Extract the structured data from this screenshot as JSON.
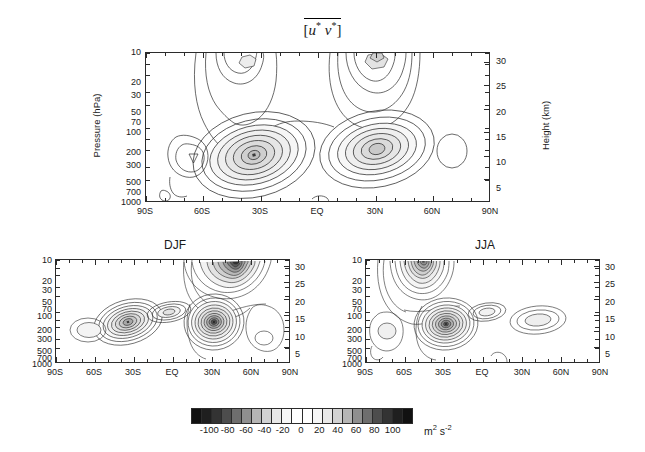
{
  "figure": {
    "title_bracket_open": "[",
    "title_u": "u",
    "title_star1": "*",
    "title_v": "v",
    "title_star2": "*",
    "title_bracket_close": "]",
    "title_plain": "[u* v*]"
  },
  "axes": {
    "ylabel_left": "Pressure  (hPa)",
    "ylabel_right": "Height  (km)",
    "pressure_ticks": [
      "10",
      "20",
      "30",
      "50",
      "70",
      "100",
      "200",
      "300",
      "500",
      "700",
      "1000"
    ],
    "pressure_values": [
      10,
      20,
      30,
      50,
      70,
      100,
      200,
      300,
      500,
      700,
      1000
    ],
    "height_ticks": [
      "30",
      "25",
      "20",
      "15",
      "10",
      "5"
    ],
    "height_values": [
      30,
      25,
      20,
      15,
      10,
      5
    ],
    "lat_ticks": [
      "90S",
      "60S",
      "30S",
      "EQ",
      "30N",
      "60N",
      "90N"
    ],
    "lat_values": [
      -90,
      -60,
      -30,
      0,
      30,
      60,
      90
    ]
  },
  "panels": [
    {
      "id": "annual",
      "title": "",
      "show_axis_titles": true
    },
    {
      "id": "djf",
      "title": "DJF",
      "show_axis_titles": false
    },
    {
      "id": "jja",
      "title": "JJA",
      "show_axis_titles": false
    }
  ],
  "colorbar": {
    "labels": [
      "-100",
      "-80",
      "-60",
      "-40",
      "-20",
      "0",
      "20",
      "40",
      "60",
      "80",
      "100"
    ],
    "label_values": [
      -100,
      -80,
      -60,
      -40,
      -20,
      0,
      20,
      40,
      60,
      80,
      100
    ],
    "unit_base": "m",
    "unit_sup1": "2",
    "unit_mid": " s",
    "unit_sup2": "-2",
    "unit_plain": "m2 s-2",
    "range": [
      -120,
      120
    ],
    "step": 10,
    "swatches": [
      "#111111",
      "#1f1f1f",
      "#333333",
      "#4d4d4d",
      "#6e6e6e",
      "#8f8f8f",
      "#b5b5b5",
      "#d2d2d2",
      "#e8e8e8",
      "#f6f6f6",
      "#ffffff",
      "#ffffff",
      "#f6f6f6",
      "#e8e8e8",
      "#d2d2d2",
      "#b5b5b5",
      "#8f8f8f",
      "#6e6e6e",
      "#4d4d4d",
      "#333333",
      "#1f1f1f",
      "#111111"
    ]
  },
  "chart_data": {
    "type": "contour",
    "xlabel": "Latitude",
    "ylabel": "Pressure (hPa)",
    "ylabel_right": "Height (km)",
    "units": "m2 s-2",
    "xlim": [
      -90,
      90
    ],
    "ylim_pressure": [
      1000,
      10
    ],
    "ylim_height": [
      0,
      32
    ],
    "contour_interval": 10,
    "grid": false,
    "legend": "colorbar-below",
    "panels": [
      {
        "name": "annual",
        "title": "[u* v*]",
        "features": [
          {
            "label": "SH subtropical jet max",
            "lat": -33,
            "pressure": 230,
            "peak_value": 75,
            "n_contours": 8,
            "sign": "positive"
          },
          {
            "label": "SH high-latitude secondary max",
            "lat": -62,
            "pressure": 300,
            "peak_value": 25,
            "n_contours": 3,
            "sign": "positive"
          },
          {
            "label": "SH stratospheric max (cut off at 10 hPa)",
            "lat": -46,
            "pressure": 11,
            "peak_value": 35,
            "n_contours": 4,
            "sign": "positive"
          },
          {
            "label": "NH subtropical jet max",
            "lat": 36,
            "pressure": 200,
            "peak_value": 60,
            "n_contours": 7,
            "sign": "positive"
          },
          {
            "label": "NH stratospheric max (cut off at 10 hPa)",
            "lat": 57,
            "pressure": 11,
            "peak_value": 45,
            "n_contours": 5,
            "sign": "positive"
          },
          {
            "label": "NH high-latitude weak cell",
            "lat": 73,
            "pressure": 230,
            "peak_value": 12,
            "n_contours": 1,
            "sign": "positive"
          },
          {
            "label": "near-surface equatorial trace",
            "lat": 5,
            "pressure": 950,
            "peak_value": 10,
            "n_contours": 1,
            "sign": "positive"
          }
        ]
      },
      {
        "name": "djf",
        "title": "DJF",
        "features": [
          {
            "label": "NH polar stratospheric maximum",
            "lat": 55,
            "pressure": 11,
            "peak_value": 120,
            "n_contours": 11,
            "sign": "positive"
          },
          {
            "label": "NH subtropical tropospheric maximum",
            "lat": 33,
            "pressure": 220,
            "peak_value": 100,
            "n_contours": 10,
            "sign": "positive"
          },
          {
            "label": "SH subtropical maximum",
            "lat": -38,
            "pressure": 240,
            "peak_value": 70,
            "n_contours": 8,
            "sign": "positive"
          },
          {
            "label": "equatorial upper-troposphere max",
            "lat": -2,
            "pressure": 150,
            "peak_value": 35,
            "n_contours": 4,
            "sign": "positive"
          },
          {
            "label": "SH high latitude cell",
            "lat": -66,
            "pressure": 300,
            "peak_value": 22,
            "n_contours": 2,
            "sign": "positive"
          },
          {
            "label": "NH polar lower-troposphere cell",
            "lat": 71,
            "pressure": 280,
            "peak_value": 18,
            "n_contours": 2,
            "sign": "positive"
          }
        ]
      },
      {
        "name": "jja",
        "title": "JJA",
        "features": [
          {
            "label": "SH polar stratospheric maximum",
            "lat": -49,
            "pressure": 11,
            "peak_value": 95,
            "n_contours": 9,
            "sign": "positive"
          },
          {
            "label": "SH subtropical tropospheric maximum",
            "lat": -34,
            "pressure": 250,
            "peak_value": 105,
            "n_contours": 10,
            "sign": "positive"
          },
          {
            "label": "SH high-latitude cell",
            "lat": -70,
            "pressure": 280,
            "peak_value": 25,
            "n_contours": 3,
            "sign": "positive"
          },
          {
            "label": "equatorial upper-troposphere max",
            "lat": -3,
            "pressure": 150,
            "peak_value": 28,
            "n_contours": 3,
            "sign": "positive"
          },
          {
            "label": "NH subtropical weak maximum",
            "lat": 36,
            "pressure": 200,
            "peak_value": 30,
            "n_contours": 3,
            "sign": "positive"
          },
          {
            "label": "near-surface equatorial trace",
            "lat": 8,
            "pressure": 960,
            "peak_value": 10,
            "n_contours": 1,
            "sign": "positive"
          }
        ]
      }
    ]
  }
}
